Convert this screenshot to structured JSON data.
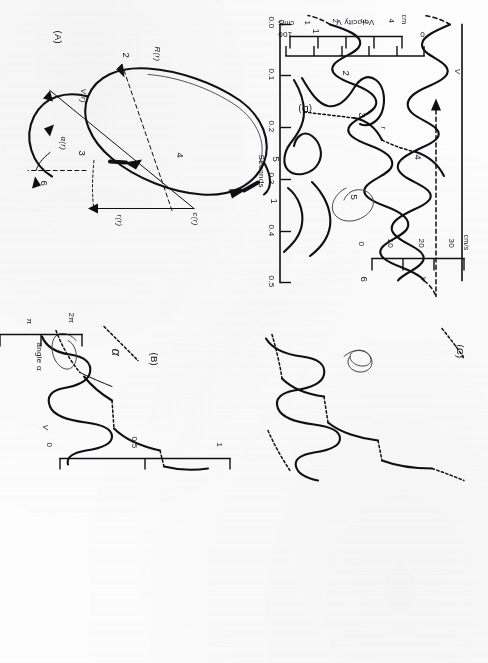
{
  "figure": {
    "caption_panels": [
      "(A)",
      "(B)",
      "(C)",
      "(D)"
    ],
    "panelA": {
      "label": "(A)",
      "point_labels": [
        "1",
        "2",
        "3",
        "4",
        "5",
        "6"
      ],
      "vector_labels": {
        "R": "R(r)",
        "V": "V(r)",
        "alpha": "α(r)",
        "c": "c(r)",
        "r": "r(r)"
      }
    },
    "panelB": {
      "label": "(B)",
      "curve_labels": [
        "α",
        "V"
      ]
    },
    "panelC": {
      "label": "(C)",
      "curve_labels": []
    },
    "panelD": {
      "label": "(D)",
      "curve_labels": []
    }
  },
  "axes": {
    "velocity_left": {
      "unit": "cm/s",
      "series_label": "V",
      "ticks": [
        "30",
        "20",
        "10",
        "0"
      ]
    },
    "radius_left": {
      "unit": "cm",
      "series_label": "r",
      "ticks": [
        "4",
        "3",
        "2",
        "1",
        "0"
      ]
    },
    "time": {
      "title": "Seconds",
      "ticks": [
        "0.0",
        "0.1",
        "0.2",
        "0.3",
        "0.4",
        "0.5"
      ]
    },
    "angle": {
      "title": "angle α",
      "ticks": [
        "2π",
        "π",
        "0"
      ]
    },
    "normalized": {
      "ticks": [
        "0",
        "0.5",
        "1"
      ]
    },
    "velocity_right": {
      "title": "Velocity V",
      "unit": "cm/s",
      "ticks": [
        "100",
        "0"
      ]
    }
  },
  "colors": {
    "ink": "#101014",
    "paper": "#ffffff",
    "faint": "#3a3a40"
  }
}
